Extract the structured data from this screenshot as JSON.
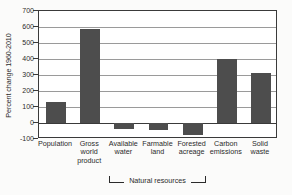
{
  "chart_data": {
    "type": "bar",
    "title": "",
    "xlabel": "",
    "ylabel": "Percent change 1960-2010",
    "ylim": [
      -100,
      700
    ],
    "yticks": [
      700,
      600,
      500,
      400,
      300,
      200,
      100,
      0,
      -100
    ],
    "ytick_labels": [
      "700",
      "600",
      "500",
      "400",
      "300",
      "200",
      "100",
      "0",
      "-100"
    ],
    "grid": true,
    "legend": "none",
    "bar_color": "#4d4d4d",
    "gridline_color": "#9a9a9a",
    "frame_color": "#3a3a3a",
    "categories": [
      "Population",
      "Gross world product",
      "Available water",
      "Farmable land",
      "Forested acreage",
      "Carbon emissions",
      "Solid waste"
    ],
    "category_labels": [
      "Population",
      "Gross\nworld\nproduct",
      "Available\nwater",
      "Farmable\nland",
      "Forested\nacreage",
      "Carbon\nemissions",
      "Solid\nwaste"
    ],
    "values": [
      130,
      585,
      -35,
      -42,
      -75,
      400,
      315
    ],
    "annotations": [
      {
        "name": "natural-resources-bracket",
        "label": "Natural resources",
        "spans": [
          "Available water",
          "Farmable land",
          "Forested acreage"
        ]
      }
    ]
  }
}
